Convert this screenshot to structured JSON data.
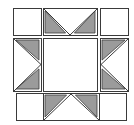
{
  "diagram": {
    "title": "Quilt block",
    "type": "sawtooth-star quilt block",
    "colors": {
      "background": "#ffffff",
      "outline": "#3a3a3a",
      "fill_gray": "#9b9b9b",
      "patch_white": "#ffffff"
    },
    "grid": {
      "rows": 3,
      "cols": 3
    },
    "patches": [
      {
        "id": "top-left",
        "kind": "plain-square",
        "x": 13,
        "y": 8,
        "w": 28,
        "h": 27
      },
      {
        "id": "top-middle",
        "kind": "flying-geese-down",
        "x": 43,
        "y": 8,
        "w": 54,
        "h": 27
      },
      {
        "id": "top-right",
        "kind": "plain-square",
        "x": 100,
        "y": 8,
        "w": 28,
        "h": 27
      },
      {
        "id": "middle-left",
        "kind": "flying-geese-right",
        "x": 13,
        "y": 38,
        "w": 28,
        "h": 53
      },
      {
        "id": "center",
        "kind": "plain-square",
        "x": 43,
        "y": 38,
        "w": 54,
        "h": 53
      },
      {
        "id": "middle-right",
        "kind": "flying-geese-left",
        "x": 100,
        "y": 38,
        "w": 28,
        "h": 53
      },
      {
        "id": "bottom-left",
        "kind": "plain-square",
        "x": 16,
        "y": 93,
        "w": 27,
        "h": 27
      },
      {
        "id": "bottom-middle",
        "kind": "flying-geese-up",
        "x": 43,
        "y": 93,
        "w": 56,
        "h": 27
      },
      {
        "id": "bottom-right",
        "kind": "plain-square",
        "x": 99,
        "y": 93,
        "w": 27,
        "h": 27
      }
    ]
  }
}
